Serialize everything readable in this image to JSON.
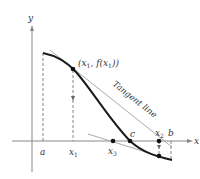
{
  "diagram": {
    "axes": {
      "x_label": "x",
      "y_label": "y"
    },
    "point_label": {
      "open": "(",
      "x": "x",
      "sub1": "1",
      "comma": ", f(",
      "x2": "x",
      "sub2": "1",
      "close": "))"
    },
    "tangent_label": "Tangent line",
    "x_labels": {
      "a": "a",
      "x1": "x",
      "x1_sub": "1",
      "x3": "x",
      "x3_sub": "3",
      "c": "c",
      "x2": "x",
      "x2_sub": "2",
      "b": "b"
    },
    "colors": {
      "axis": "#888888",
      "curve": "#1a1a1a",
      "tangent": "#aaaaaa",
      "dash": "#666666",
      "text": "#333333"
    }
  }
}
